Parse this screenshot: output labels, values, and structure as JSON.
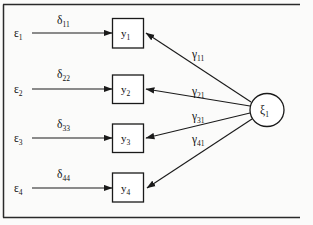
{
  "figure": {
    "type": "path-diagram",
    "colors": {
      "stroke": "#1a1a1a",
      "frame": "#2a2a2a",
      "background": "#fbfbfa",
      "node_fill": "#ffffff"
    },
    "frame": {
      "top_rule": true,
      "bottom_rule": true,
      "left_rule": true,
      "right_rule": false
    }
  },
  "latent": {
    "symbol": "ξ",
    "subscript": "1",
    "shape": "ellipse"
  },
  "rows": [
    {
      "error_symbol": "ε",
      "error_subscript": "1",
      "path_symbol": "δ",
      "path_subscript": "11",
      "indicator_symbol": "y",
      "indicator_subscript": "1",
      "loading_symbol": "γ",
      "loading_subscript": "11"
    },
    {
      "error_symbol": "ε",
      "error_subscript": "2",
      "path_symbol": "δ",
      "path_subscript": "22",
      "indicator_symbol": "y",
      "indicator_subscript": "2",
      "loading_symbol": "γ",
      "loading_subscript": "21"
    },
    {
      "error_symbol": "ε",
      "error_subscript": "3",
      "path_symbol": "δ",
      "path_subscript": "33",
      "indicator_symbol": "y",
      "indicator_subscript": "3",
      "loading_symbol": "γ",
      "loading_subscript": "31"
    },
    {
      "error_symbol": "ε",
      "error_subscript": "4",
      "path_symbol": "δ",
      "path_subscript": "44",
      "indicator_symbol": "y",
      "indicator_subscript": "4",
      "loading_symbol": "γ",
      "loading_subscript": "41"
    }
  ]
}
